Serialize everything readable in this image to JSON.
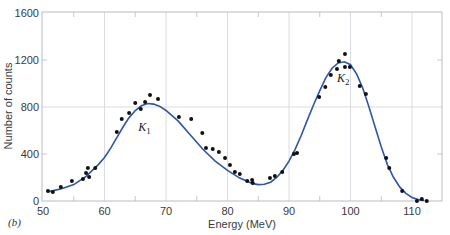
{
  "chart_data": {
    "type": "scatter",
    "title": "",
    "panel_label": "(b)",
    "xlabel": "Energy (MeV)",
    "ylabel": "Number of counts",
    "xlim": [
      50,
      115
    ],
    "ylim": [
      0,
      1600
    ],
    "x_ticks": [
      50,
      60,
      70,
      80,
      90,
      100,
      110
    ],
    "y_ticks": [
      0,
      400,
      800,
      1200,
      1600
    ],
    "grid": {
      "vertical": [
        60,
        70,
        80,
        90,
        100,
        110
      ],
      "horizontal": [
        800
      ]
    },
    "colors": {
      "curve": "#2f55a4",
      "points": "#111111",
      "grid": "#cfd3d8",
      "frame": "#b8bcc2"
    },
    "annotations": [
      {
        "text": "K",
        "sub": "1",
        "x": 65.5,
        "y": 600
      },
      {
        "text": "K",
        "sub": "2",
        "x": 97.8,
        "y": 1010
      }
    ],
    "series": [
      {
        "name": "Measured counts",
        "kind": "scatter",
        "x": [
          50.8,
          51.6,
          52.9,
          54.7,
          56.5,
          57.0,
          57.3,
          57.5,
          58.5,
          62.0,
          62.8,
          64.0,
          65.0,
          65.9,
          66.6,
          67.4,
          68.7,
          72.1,
          74.1,
          75.9,
          76.5,
          77.6,
          78.6,
          79.6,
          80.4,
          81.2,
          82.0,
          83.2,
          84.0,
          84.1,
          86.9,
          87.7,
          88.9,
          90.8,
          91.3,
          94.9,
          95.9,
          96.8,
          97.8,
          98.1,
          99.1,
          99.1,
          99.9,
          101.5,
          102.5,
          105.8,
          106.3,
          108.4,
          110.8,
          111.6,
          112.4
        ],
        "y": [
          85,
          77,
          119,
          170,
          187,
          238,
          281,
          204,
          281,
          587,
          698,
          749,
          834,
          783,
          843,
          902,
          868,
          715,
          698,
          579,
          451,
          443,
          417,
          366,
          306,
          247,
          230,
          170,
          179,
          153,
          196,
          213,
          247,
          400,
          409,
          885,
          970,
          1072,
          1123,
          1191,
          1251,
          1140,
          1140,
          979,
          911,
          366,
          281,
          85,
          0,
          17,
          0
        ]
      },
      {
        "name": "Fitted curve",
        "kind": "line",
        "x": [
          51,
          53,
          55,
          57,
          59,
          60,
          61,
          62,
          63,
          64,
          65,
          66,
          67,
          68,
          69,
          70,
          72,
          74,
          76,
          78,
          80,
          82,
          84,
          85,
          86,
          87,
          88,
          89,
          90,
          91,
          92,
          93,
          94,
          95,
          96,
          97,
          98,
          99,
          100,
          101,
          102,
          103,
          104,
          105,
          106,
          107,
          108,
          109,
          110,
          111,
          112
        ],
        "y": [
          80,
          105,
          140,
          210,
          310,
          370,
          450,
          540,
          630,
          710,
          770,
          810,
          830,
          825,
          805,
          770,
          680,
          560,
          440,
          340,
          260,
          195,
          150,
          140,
          142,
          160,
          200,
          260,
          340,
          440,
          560,
          690,
          820,
          940,
          1050,
          1130,
          1175,
          1185,
          1160,
          1080,
          960,
          800,
          630,
          460,
          310,
          200,
          120,
          65,
          30,
          12,
          4
        ]
      }
    ]
  }
}
